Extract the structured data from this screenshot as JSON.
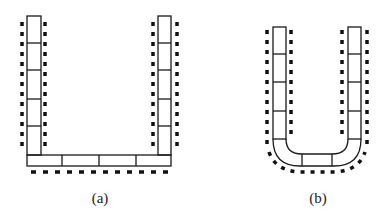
{
  "figures": [
    {
      "id": "a",
      "label": "(a)",
      "description": "U-shaped arrangement of rectangular blocks with square corners, dashed outline"
    },
    {
      "id": "b",
      "label": "(b)",
      "description": "U-shaped arrangement of rectangular blocks with rounded bottom corners, dashed outline"
    }
  ],
  "colors": {
    "stroke": "#1a1a1a",
    "dash": "#111111",
    "fill": "#ffffff"
  }
}
